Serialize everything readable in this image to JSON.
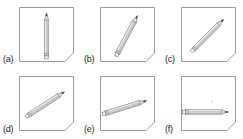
{
  "figure": {
    "type": "multi-panel-illustration",
    "background_color": "#ffffff",
    "frame_color": "#9a9a9a",
    "pencil_body_color": "#d8d8d8",
    "pencil_lead_color": "#3a3a3a",
    "label_color": "#1a1a1a",
    "columns": 3,
    "rows": 2,
    "panel_shape": "square-with-chamfered-bottom-right-corner",
    "panels": [
      {
        "id": "a",
        "label": "(a)",
        "pencil_angle_degrees": 90,
        "orientation": "vertical",
        "tip_position": "top",
        "blunt_end_position": "bottom",
        "pencil_length_ratio": 0.78
      },
      {
        "id": "b",
        "label": "(b)",
        "pencil_angle_degrees": 62,
        "orientation": "steep-diagonal",
        "tip_position": "top-right",
        "blunt_end_position": "bottom-left",
        "pencil_length_ratio": 0.78
      },
      {
        "id": "c",
        "label": "(c)",
        "pencil_angle_degrees": 45,
        "orientation": "diagonal",
        "tip_position": "top-right",
        "blunt_end_position": "bottom-left",
        "pencil_length_ratio": 0.78
      },
      {
        "id": "d",
        "label": "(d)",
        "pencil_angle_degrees": 33,
        "orientation": "shallow-diagonal",
        "tip_position": "top-right",
        "blunt_end_position": "bottom-left",
        "pencil_length_ratio": 0.78
      },
      {
        "id": "e",
        "label": "(e)",
        "pencil_angle_degrees": 17,
        "orientation": "near-horizontal",
        "tip_position": "right",
        "blunt_end_position": "left",
        "pencil_length_ratio": 0.78
      },
      {
        "id": "f",
        "label": "(f)",
        "pencil_angle_degrees": 0,
        "orientation": "horizontal",
        "tip_position": "right",
        "blunt_end_position": "left",
        "pencil_length_ratio": 0.78
      }
    ]
  }
}
